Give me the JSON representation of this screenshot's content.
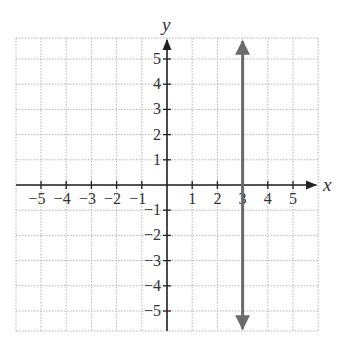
{
  "chart_data": {
    "type": "line",
    "title": "",
    "xlabel": "x",
    "ylabel": "y",
    "xlim": [
      -6,
      6
    ],
    "ylim": [
      -6,
      6
    ],
    "grid": true,
    "x_ticks": [
      -5,
      -4,
      -3,
      -2,
      -1,
      1,
      2,
      3,
      4,
      5
    ],
    "y_ticks": [
      5,
      4,
      3,
      2,
      1,
      -1,
      -2,
      -3,
      -4,
      -5
    ],
    "x_tick_labels": [
      "−5",
      "−4",
      "−3",
      "−2",
      "−1",
      "1",
      "2",
      "3",
      "4",
      "5"
    ],
    "y_tick_labels": [
      "5",
      "4",
      "3",
      "2",
      "1",
      "−1",
      "−2",
      "−3",
      "−4",
      "−5"
    ],
    "series": [
      {
        "name": "x = 3",
        "kind": "vertical-line",
        "x": [
          3,
          3
        ],
        "y": [
          -5.7,
          5.7
        ],
        "arrows": "both",
        "color": "#6b6b6b"
      }
    ],
    "legend": null
  },
  "colors": {
    "grid": "#b5b5b5",
    "axis": "#222222",
    "line": "#6b6b6b"
  }
}
